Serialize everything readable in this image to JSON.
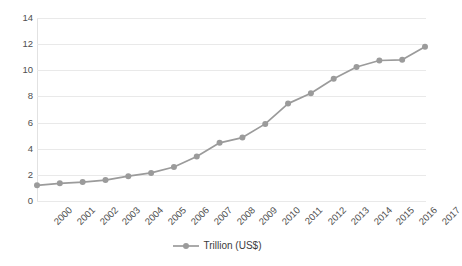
{
  "chart_data": {
    "type": "line",
    "title": "",
    "subtitle": "",
    "xlabel": "",
    "ylabel": "",
    "ylim": [
      0,
      14
    ],
    "ytick_step": 2,
    "yticks": [
      "14",
      "12",
      "10",
      "8",
      "6",
      "4",
      "2",
      "0"
    ],
    "grid": "horizontal",
    "legend_position": "bottom-center",
    "marker": "circle",
    "categories": [
      "2000",
      "2001",
      "2002",
      "2003",
      "2004",
      "2005",
      "2006",
      "2007",
      "2008",
      "2009",
      "2010",
      "2011",
      "2012",
      "2013",
      "2014",
      "2015",
      "2016",
      "2017"
    ],
    "series": [
      {
        "name": "Trillion (US$)",
        "color": "#9b9b9b",
        "values": [
          1.2,
          1.35,
          1.45,
          1.6,
          1.9,
          2.15,
          2.6,
          3.4,
          4.45,
          4.85,
          5.9,
          7.45,
          8.25,
          9.35,
          10.25,
          10.75,
          10.8,
          11.8
        ]
      }
    ]
  },
  "legend": {
    "entries": [
      {
        "label": "Trillion (US$)"
      }
    ]
  },
  "colors": {
    "series": "#9b9b9b",
    "gridline": "#e9e9e9",
    "axis": "#d9d9d9",
    "tick_text": "#4f4f4f",
    "background": "#ffffff"
  }
}
